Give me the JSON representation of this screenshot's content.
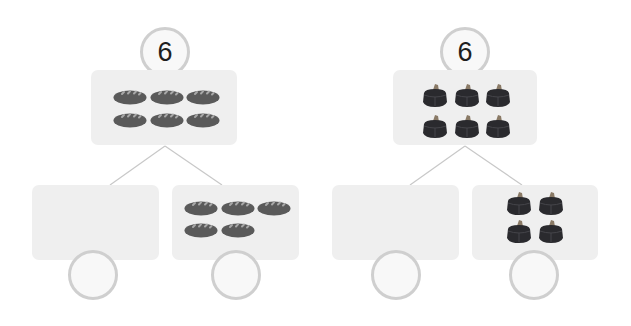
{
  "colors": {
    "box_bg": "#efefef",
    "circle_border": "#cfcfcf",
    "circle_bg": "#f8f8f8",
    "line": "#c8c8c8",
    "bread_body": "#5a5a5a",
    "bread_slash": "#9a9a9a",
    "cake_body": "#2a2a2e",
    "cake_top": "#8a7a66"
  },
  "groups": [
    {
      "id": "bread",
      "icon": "bread-icon",
      "whole": {
        "value": "6",
        "count": 6
      },
      "left_part": {
        "value": "",
        "count": 0
      },
      "right_part": {
        "value": "",
        "count": 5
      }
    },
    {
      "id": "cake",
      "icon": "cake-icon",
      "whole": {
        "value": "6",
        "count": 6
      },
      "left_part": {
        "value": "",
        "count": 0
      },
      "right_part": {
        "value": "",
        "count": 4
      }
    }
  ]
}
